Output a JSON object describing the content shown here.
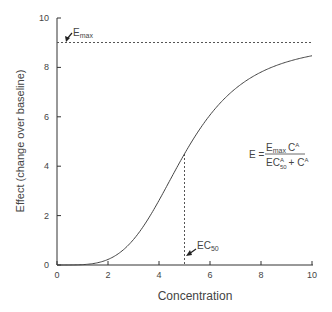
{
  "chart_data": {
    "type": "line",
    "title": "",
    "xlabel": "Concentration",
    "ylabel": "Effect (change over baseline)",
    "xlim": [
      0,
      10
    ],
    "ylim": [
      0,
      10
    ],
    "xticks": [
      "0",
      "2",
      "4",
      "6",
      "8",
      "10"
    ],
    "yticks": [
      "0",
      "2",
      "4",
      "6",
      "8",
      "10"
    ],
    "grid": false,
    "model": {
      "name": "Sigmoid Emax (Hill)",
      "Emax": 9,
      "EC50": 5,
      "gamma": 4
    },
    "series": [
      {
        "name": "E",
        "x": [
          0,
          1,
          1.5,
          2,
          2.5,
          3,
          3.5,
          4,
          4.5,
          5,
          5.5,
          6,
          6.5,
          7,
          7.5,
          8,
          8.5,
          9,
          9.5,
          10
        ],
        "values": [
          0,
          0.01,
          0.07,
          0.22,
          0.53,
          1.01,
          1.64,
          2.34,
          3.05,
          4.5,
          5.2,
          6.03,
          6.63,
          7.13,
          7.52,
          7.84,
          8.06,
          8.25,
          8.39,
          8.47
        ]
      }
    ],
    "annotations": [
      {
        "type": "hline",
        "y": 9,
        "style": "dotted",
        "label": "Emax"
      },
      {
        "type": "vline",
        "x": 5,
        "y_to": 4.5,
        "style": "dotted",
        "label": "EC50"
      },
      {
        "type": "equation",
        "text": "E = Emax C^A / (EC50^A + C^A)"
      }
    ]
  },
  "labels": {
    "emax_main": "E",
    "emax_sub": "max",
    "ec50_main": "EC",
    "ec50_sub": "50",
    "eq_lhs": "E =",
    "eq_num_e": "E",
    "eq_num_sub": "max",
    "eq_num_c": "C",
    "eq_num_sup": "A",
    "eq_den_ec": "EC",
    "eq_den_sup": "A",
    "eq_den_sub": "50",
    "eq_den_plus": "+ C",
    "eq_den_sup2": "A"
  }
}
